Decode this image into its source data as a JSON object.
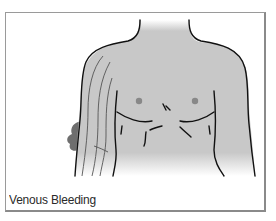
{
  "figure": {
    "caption": "Venous Bleeding",
    "highlight": "bleeding-on-right-upper-arm",
    "colors": {
      "skin": "#c8c8c8",
      "outline": "#111111",
      "blood": "#6e6e6e",
      "nipple": "#888888",
      "frame_border": "#8a8a8a"
    }
  }
}
